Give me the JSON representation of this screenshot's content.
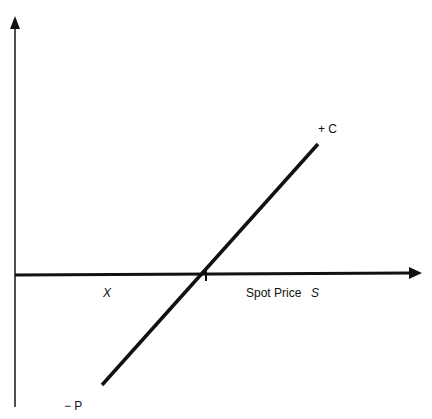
{
  "diagram": {
    "type": "payoff-diagram",
    "axes": {
      "x_axis_label": "Spot Price",
      "x_axis_symbol": "S",
      "strike_label": "X"
    },
    "line_labels": {
      "top": "+ C",
      "bottom": "− P"
    },
    "colors": {
      "line": "#111111",
      "axis": "#111111",
      "background": "#ffffff"
    }
  }
}
